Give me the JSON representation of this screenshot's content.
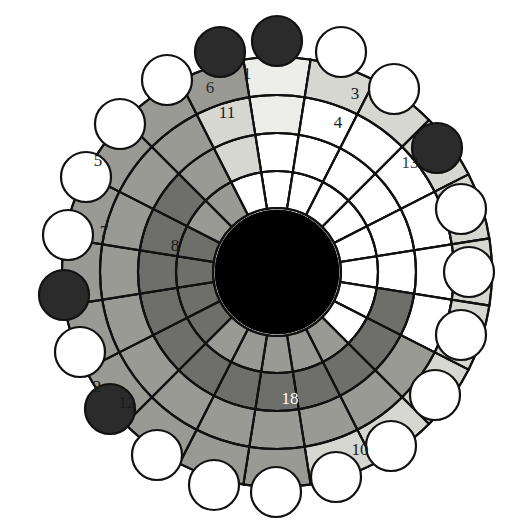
{
  "figure": {
    "type": "radial-sunburst",
    "background_color": "#ffffff",
    "outline_color": "#111111",
    "center": {
      "x": 277,
      "y": 272
    },
    "hub": {
      "radius": 62,
      "color": "#000000"
    },
    "sector_count": 20,
    "start_angle_deg": -99,
    "rings": [
      {
        "index": 0,
        "name": "ring-inner",
        "r_inner": 64,
        "r_outer": 101
      },
      {
        "index": 1,
        "name": "ring-second",
        "r_inner": 101,
        "r_outer": 139
      },
      {
        "index": 2,
        "name": "ring-third",
        "r_inner": 139,
        "r_outer": 177
      },
      {
        "index": 3,
        "name": "ring-outer",
        "r_inner": 177,
        "r_outer": 215
      }
    ],
    "palette": {
      "white": "#ffffff",
      "very_light_gray": "#ededea",
      "light_gray": "#d7d7d2",
      "mid_gray": "#9a9a95",
      "dark_gray": "#6e6e6a",
      "black": "#000000",
      "node_dark": "#2b2b2b"
    },
    "cell_colors": {
      "comment": "4 rings x 20 sectors, index 0 = innermost ring, sector 0 starts at top and proceeds clockwise",
      "ring0": [
        "white",
        "white",
        "white",
        "white",
        "white",
        "white",
        "white",
        "white",
        "mid_gray",
        "mid_gray",
        "mid_gray",
        "mid_gray",
        "mid_gray",
        "dark_gray",
        "dark_gray",
        "dark_gray",
        "dark_gray",
        "mid_gray",
        "mid_gray",
        "white"
      ],
      "ring1": [
        "white",
        "white",
        "white",
        "white",
        "white",
        "white",
        "dark_gray",
        "dark_gray",
        "dark_gray",
        "dark_gray",
        "dark_gray",
        "dark_gray",
        "dark_gray",
        "dark_gray",
        "dark_gray",
        "dark_gray",
        "dark_gray",
        "dark_gray",
        "mid_gray",
        "light_gray"
      ],
      "ring2": [
        "very_light_gray",
        "white",
        "white",
        "white",
        "white",
        "white",
        "white",
        "mid_gray",
        "mid_gray",
        "mid_gray",
        "mid_gray",
        "mid_gray",
        "mid_gray",
        "mid_gray",
        "mid_gray",
        "mid_gray",
        "mid_gray",
        "mid_gray",
        "mid_gray",
        "light_gray"
      ],
      "ring3": [
        "very_light_gray",
        "light_gray",
        "light_gray",
        "light_gray",
        "light_gray",
        "light_gray",
        "light_gray",
        "light_gray",
        "light_gray",
        "light_gray",
        "mid_gray",
        "mid_gray",
        "mid_gray",
        "mid_gray",
        "mid_gray",
        "mid_gray",
        "mid_gray",
        "mid_gray",
        "mid_gray",
        "mid_gray"
      ]
    },
    "labels": [
      {
        "id": "label-1",
        "text": "1",
        "x": 247,
        "y": 79,
        "color": "dark",
        "anchor": "middle"
      },
      {
        "id": "label-6",
        "text": "6",
        "x": 210,
        "y": 93,
        "color": "dark",
        "anchor": "middle",
        "occluded": true
      },
      {
        "id": "label-3",
        "text": "3",
        "x": 355,
        "y": 99,
        "color": "dark",
        "anchor": "middle"
      },
      {
        "id": "label-11",
        "text": "11",
        "x": 227,
        "y": 118,
        "color": "dark",
        "anchor": "middle"
      },
      {
        "id": "label-4",
        "text": "4",
        "x": 338,
        "y": 128,
        "color": "dark",
        "anchor": "middle"
      },
      {
        "id": "label-13",
        "text": "13",
        "x": 410,
        "y": 168,
        "color": "dark",
        "anchor": "middle",
        "occluded": true
      },
      {
        "id": "label-5",
        "text": "5",
        "x": 98,
        "y": 166,
        "color": "dark",
        "anchor": "middle"
      },
      {
        "id": "label-7",
        "text": "7",
        "x": 104,
        "y": 237,
        "color": "dark",
        "anchor": "middle"
      },
      {
        "id": "label-8",
        "text": "8",
        "x": 175,
        "y": 251,
        "color": "dark",
        "anchor": "middle"
      },
      {
        "id": "label-2",
        "text": "2",
        "x": 97,
        "y": 392,
        "color": "dark",
        "anchor": "middle"
      },
      {
        "id": "label-12",
        "text": "12",
        "x": 127,
        "y": 408,
        "color": "dark",
        "anchor": "middle",
        "occluded": true
      },
      {
        "id": "label-18",
        "text": "18",
        "x": 290,
        "y": 404,
        "color": "light",
        "anchor": "middle"
      },
      {
        "id": "label-10",
        "text": "10",
        "x": 360,
        "y": 455,
        "color": "dark",
        "anchor": "middle"
      }
    ],
    "nodes": [
      {
        "index": 0,
        "name": "node-0",
        "fill": "dark",
        "cx": 277,
        "cy": 41
      },
      {
        "index": 1,
        "name": "node-1",
        "fill": "white",
        "cx": 341,
        "cy": 52
      },
      {
        "index": 2,
        "name": "node-2",
        "fill": "white",
        "cx": 394,
        "cy": 89
      },
      {
        "index": 3,
        "name": "node-3",
        "fill": "dark",
        "cx": 437,
        "cy": 148
      },
      {
        "index": 4,
        "name": "node-4",
        "fill": "white",
        "cx": 461,
        "cy": 209
      },
      {
        "index": 5,
        "name": "node-5",
        "fill": "white",
        "cx": 469,
        "cy": 272
      },
      {
        "index": 6,
        "name": "node-6",
        "fill": "white",
        "cx": 461,
        "cy": 335
      },
      {
        "index": 7,
        "name": "node-7",
        "fill": "white",
        "cx": 435,
        "cy": 395
      },
      {
        "index": 8,
        "name": "node-8",
        "fill": "white",
        "cx": 391,
        "cy": 446
      },
      {
        "index": 9,
        "name": "node-9",
        "fill": "white",
        "cx": 336,
        "cy": 477
      },
      {
        "index": 10,
        "name": "node-10",
        "fill": "white",
        "cx": 276,
        "cy": 492
      },
      {
        "index": 11,
        "name": "node-11",
        "fill": "white",
        "cx": 214,
        "cy": 485
      },
      {
        "index": 12,
        "name": "node-12",
        "fill": "white",
        "cx": 157,
        "cy": 455
      },
      {
        "index": 13,
        "name": "node-13",
        "fill": "dark",
        "cx": 110,
        "cy": 409
      },
      {
        "index": 14,
        "name": "node-14",
        "fill": "white",
        "cx": 80,
        "cy": 352
      },
      {
        "index": 15,
        "name": "node-15",
        "fill": "dark",
        "cx": 64,
        "cy": 295
      },
      {
        "index": 16,
        "name": "node-16",
        "fill": "white",
        "cx": 68,
        "cy": 235
      },
      {
        "index": 17,
        "name": "node-17",
        "fill": "white",
        "cx": 86,
        "cy": 177
      },
      {
        "index": 18,
        "name": "node-18",
        "fill": "white",
        "cx": 120,
        "cy": 124
      },
      {
        "index": 19,
        "name": "node-19",
        "fill": "white",
        "cx": 167,
        "cy": 80
      },
      {
        "index": 20,
        "name": "node-20",
        "fill": "dark",
        "cx": 220,
        "cy": 52
      }
    ],
    "node_radius": 25
  }
}
